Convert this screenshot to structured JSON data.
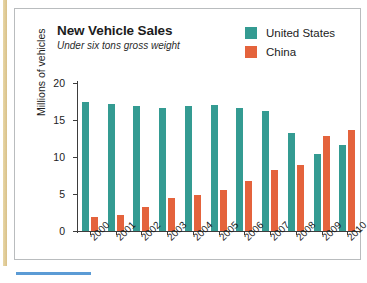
{
  "figure": {
    "title": "New Vehicle Sales",
    "subtitle": "Under six tons gross weight"
  },
  "legend": {
    "position": "top-right",
    "entries": [
      {
        "label": "United States",
        "color": "#349b92"
      },
      {
        "label": "China",
        "color": "#e4633c"
      }
    ]
  },
  "axes": {
    "ylabel": "Millions of vehicles",
    "yticks": [
      "0",
      "5",
      "10",
      "15",
      "20"
    ],
    "xlabel": ""
  },
  "colors": {
    "united_states": "#349b92",
    "china": "#e4633c",
    "axis": "#3d3d3d",
    "frame": "#b9bcbe",
    "rail": "#d9c189",
    "rule": "#5b9bd5"
  },
  "chart_data": {
    "type": "bar",
    "title": "New Vehicle Sales",
    "subtitle": "Under six tons gross weight",
    "xlabel": "",
    "ylabel": "Millions of vehicles",
    "ylim": [
      0,
      20
    ],
    "yticks": [
      0,
      5,
      10,
      15,
      20
    ],
    "grid": false,
    "legend_position": "top-right",
    "categories": [
      "2000",
      "2001",
      "2002",
      "2003",
      "2004",
      "2005",
      "2006",
      "2007",
      "2008",
      "2009",
      "2010"
    ],
    "series": [
      {
        "name": "United States",
        "color": "#349b92",
        "values": [
          17.4,
          17.1,
          16.9,
          16.6,
          16.9,
          17.0,
          16.6,
          16.2,
          13.3,
          10.4,
          11.6
        ]
      },
      {
        "name": "China",
        "color": "#e4633c",
        "values": [
          1.9,
          2.2,
          3.2,
          4.4,
          4.9,
          5.5,
          6.8,
          8.2,
          8.9,
          12.8,
          13.7
        ]
      }
    ]
  }
}
